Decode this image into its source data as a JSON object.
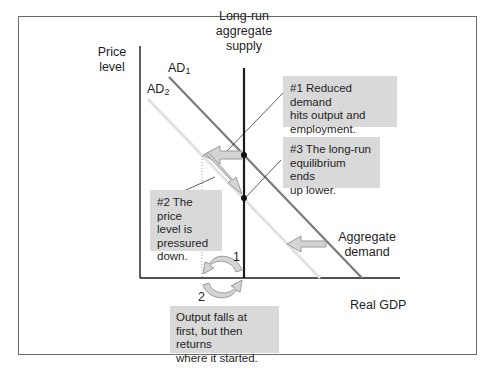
{
  "axes": {
    "y_label_line1": "Price",
    "y_label_line2": "level",
    "x_label": "Real GDP"
  },
  "curves": {
    "lras_line1": "Long-run",
    "lras_line2": "aggregate",
    "lras_line3": "supply",
    "ad1_base": "AD",
    "ad1_sub": "1",
    "ad2_base": "AD",
    "ad2_sub": "2",
    "ad_shift_line1": "Aggregate",
    "ad_shift_line2": "demand"
  },
  "callouts": {
    "c1": [
      "#1 Reduced demand",
      "hits output and",
      "employment."
    ],
    "c2": [
      "#2 The price",
      "level is",
      "pressured",
      "down."
    ],
    "c3": [
      "#3 The long-run",
      "equilibrium ends",
      "up lower."
    ],
    "c4": [
      "Output falls at",
      "first, but then returns",
      "where it started."
    ]
  },
  "cycle_labels": {
    "step1": "1",
    "step2": "2"
  },
  "colors": {
    "ad1": "#7a7a7a",
    "ad2": "#e2e2e2",
    "lras": "#1a1a1a",
    "callout_bg": "#d9d9d9",
    "arrow_fill": "#d4d4d4",
    "arrow_stroke": "#9a9a9a"
  }
}
